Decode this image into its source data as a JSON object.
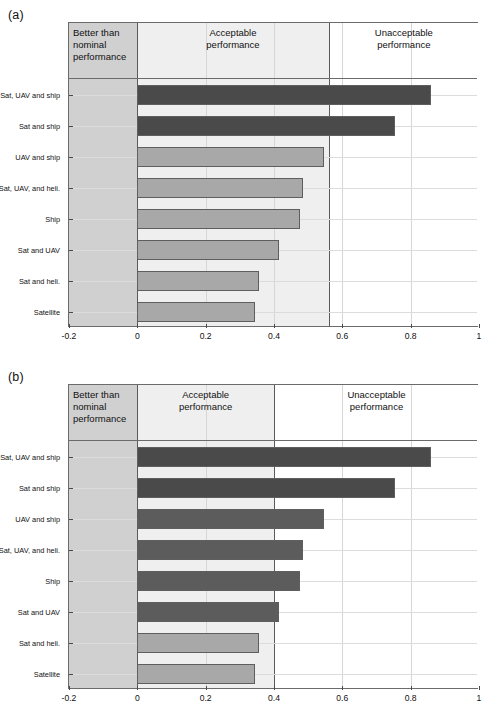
{
  "figure": {
    "panels": [
      {
        "tag": "(a)",
        "zones": [
          {
            "label": "Better than\nnominal\nperformance",
            "from": -0.2,
            "to": 0.0,
            "fill": "#d0d0d0",
            "align": "left"
          },
          {
            "label": "Acceptable\nperformance",
            "from": 0.0,
            "to": 0.56,
            "fill": "#efefef",
            "align": "center"
          },
          {
            "label": "Unacceptable\nperformance",
            "from": 0.56,
            "to": 1.0,
            "fill": "#ffffff",
            "align": "center"
          }
        ],
        "chart_data": {
          "type": "bar",
          "orientation": "horizontal",
          "title": "",
          "xlabel": "",
          "ylabel": "",
          "xlim": [
            -0.2,
            1
          ],
          "xticks": [
            -0.2,
            0,
            0.2,
            0.4,
            0.6,
            0.8,
            1
          ],
          "xticklabels": [
            "-0.2",
            "0",
            "0.2",
            "0.4",
            "0.6",
            "0.8",
            "1"
          ],
          "grid": true,
          "legend": "none",
          "categories": [
            "Sat, UAV and ship",
            "Sat and ship",
            "UAV and ship",
            "Sat, UAV, and heli.",
            "Ship",
            "Sat and UAV",
            "Sat and heli.",
            "Satellite"
          ],
          "values": [
            0.86,
            0.755,
            0.545,
            0.485,
            0.475,
            0.415,
            0.355,
            0.345
          ],
          "bar_colors": [
            "#4a4a4a",
            "#4a4a4a",
            "#a8a8a8",
            "#a8a8a8",
            "#a8a8a8",
            "#a8a8a8",
            "#a8a8a8",
            "#a8a8a8"
          ]
        }
      },
      {
        "tag": "(b)",
        "zones": [
          {
            "label": "Better than\nnominal\nperformance",
            "from": -0.2,
            "to": 0.0,
            "fill": "#d0d0d0",
            "align": "left"
          },
          {
            "label": "Acceptable\nperformance",
            "from": 0.0,
            "to": 0.4,
            "fill": "#efefef",
            "align": "center"
          },
          {
            "label": "Unacceptable\nperformance",
            "from": 0.4,
            "to": 1.0,
            "fill": "#ffffff",
            "align": "center"
          }
        ],
        "chart_data": {
          "type": "bar",
          "orientation": "horizontal",
          "title": "",
          "xlabel": "",
          "ylabel": "",
          "xlim": [
            -0.2,
            1
          ],
          "xticks": [
            -0.2,
            0,
            0.2,
            0.4,
            0.6,
            0.8,
            1
          ],
          "xticklabels": [
            "-0.2",
            "0",
            "0.2",
            "0.4",
            "0.6",
            "0.8",
            "1"
          ],
          "grid": true,
          "legend": "none",
          "categories": [
            "Sat, UAV and ship",
            "Sat and ship",
            "UAV and ship",
            "Sat, UAV, and heli.",
            "Ship",
            "Sat and UAV",
            "Sat and heli.",
            "Satellite"
          ],
          "values": [
            0.86,
            0.755,
            0.545,
            0.485,
            0.475,
            0.415,
            0.355,
            0.345
          ],
          "bar_colors": [
            "#4a4a4a",
            "#4a4a4a",
            "#5c5c5c",
            "#5c5c5c",
            "#5c5c5c",
            "#5c5c5c",
            "#a8a8a8",
            "#a8a8a8"
          ]
        }
      }
    ]
  }
}
